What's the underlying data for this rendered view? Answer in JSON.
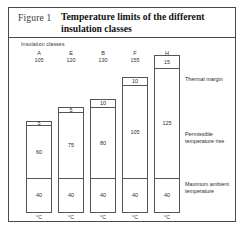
{
  "figure": {
    "label": "Figure 1",
    "title": "Temperature limits of the different insulation classes",
    "classes_caption": "Insulation classes",
    "unit_label": "°C"
  },
  "side_labels": {
    "thermal_margin": "Thermal margin",
    "permissible_rise": "Permissible temperature rise",
    "max_ambient": "Maximum ambient temperature"
  },
  "chart_data": {
    "type": "bar",
    "title": "Temperature limits of the different insulation classes",
    "xlabel": "Insulation classes",
    "ylabel": "°C",
    "ylim": [
      0,
      180
    ],
    "grid": false,
    "stacked": true,
    "legend_position": "right",
    "categories": [
      "A",
      "E",
      "B",
      "F",
      "H"
    ],
    "class_limits": [
      105,
      120,
      130,
      155,
      180
    ],
    "series": [
      {
        "name": "Maximum ambient temperature",
        "values": [
          40,
          40,
          40,
          40,
          40
        ]
      },
      {
        "name": "Permissible temperature rise",
        "values": [
          60,
          75,
          80,
          105,
          125
        ]
      },
      {
        "name": "Thermal margin",
        "values": [
          5,
          5,
          10,
          10,
          15
        ]
      }
    ],
    "bars": [
      {
        "class": "A",
        "limit": 105,
        "ambient": 40,
        "rise": 60,
        "margin": 5
      },
      {
        "class": "E",
        "limit": 120,
        "ambient": 40,
        "rise": 75,
        "margin": 5
      },
      {
        "class": "B",
        "limit": 130,
        "ambient": 40,
        "rise": 80,
        "margin": 10
      },
      {
        "class": "F",
        "limit": 155,
        "ambient": 40,
        "rise": 105,
        "margin": 10
      },
      {
        "class": "H",
        "limit": 180,
        "ambient": 40,
        "rise": 125,
        "margin": 15
      }
    ]
  }
}
